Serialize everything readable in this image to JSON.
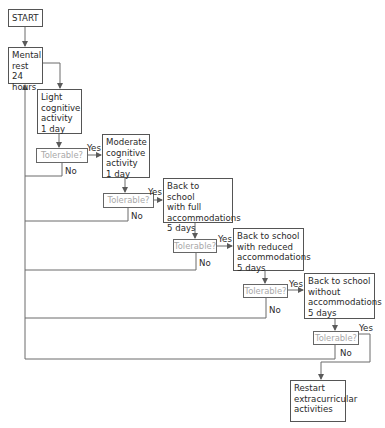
{
  "flowchart": {
    "start": {
      "label": "START"
    },
    "steps": [
      {
        "id": "mental-rest",
        "label": "Mental\nrest 24\nhours"
      },
      {
        "id": "light-cognitive",
        "label": "Light\ncognitive\nactivity\n1 day"
      },
      {
        "id": "moderate-cognitive",
        "label": "Moderate\ncognitive\nactivity\n1 day"
      },
      {
        "id": "school-full",
        "label": "Back to school\nwith full\naccommodations\n5 days"
      },
      {
        "id": "school-reduced",
        "label": "Back to school\nwith reduced\naccommodations\n5 days"
      },
      {
        "id": "school-without",
        "label": "Back to school\nwithout\naccommodations\n5 days"
      },
      {
        "id": "restart-extracurricular",
        "label": "Restart\nextracurricular\nactivities"
      }
    ],
    "decisions": [
      {
        "label": "Tolerable?",
        "yes": "Yes",
        "no": "No"
      },
      {
        "label": "Tolerable?",
        "yes": "Yes",
        "no": "No"
      },
      {
        "label": "Tolerable?",
        "yes": "Yes",
        "no": "No"
      },
      {
        "label": "Tolerable?",
        "yes": "Yes",
        "no": "No"
      },
      {
        "label": "Tolerable?",
        "yes": "Yes",
        "no": "No"
      }
    ]
  },
  "colors": {
    "line": "#5a5a5a",
    "box_border": "#555555",
    "decision_text": "#a8a8a8",
    "text": "#2a2a2a"
  }
}
